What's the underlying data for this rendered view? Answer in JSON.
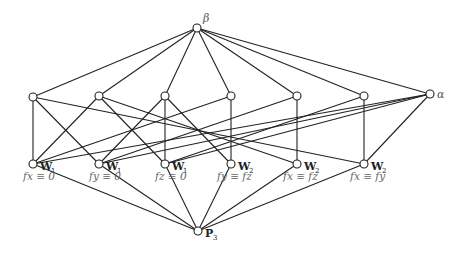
{
  "diagram": {
    "type": "lattice (Hasse diagram)",
    "colors": {
      "line": "#222222",
      "node_fill": "#ffffff",
      "label": "#555555"
    },
    "nodes": [
      {
        "id": "beta",
        "label": "β",
        "x": 197,
        "y": 28
      },
      {
        "id": "m1",
        "label": "",
        "x": 33,
        "y": 97
      },
      {
        "id": "m2",
        "label": "",
        "x": 99,
        "y": 96
      },
      {
        "id": "m3",
        "label": "",
        "x": 165,
        "y": 96
      },
      {
        "id": "m4",
        "label": "",
        "x": 231,
        "y": 96
      },
      {
        "id": "m5",
        "label": "",
        "x": 297,
        "y": 96
      },
      {
        "id": "m6",
        "label": "",
        "x": 364,
        "y": 96
      },
      {
        "id": "alpha",
        "label": "α",
        "x": 430,
        "y": 94
      },
      {
        "id": "b1",
        "label": "W",
        "sub": "1",
        "eq": "fx ≡ 0",
        "x": 33,
        "y": 164
      },
      {
        "id": "b2",
        "label": "W",
        "sub": "1",
        "eq": "fy ≡ 0",
        "x": 99,
        "y": 164
      },
      {
        "id": "b3",
        "label": "W",
        "sub": "1",
        "eq": "fz ≡ 0",
        "x": 165,
        "y": 164
      },
      {
        "id": "b4",
        "label": "W",
        "sub": "2",
        "eq": "fy ≡ fz",
        "x": 231,
        "y": 164
      },
      {
        "id": "b5",
        "label": "W",
        "sub": "2",
        "eq": "fx ≡ fz",
        "x": 297,
        "y": 164
      },
      {
        "id": "b6",
        "label": "W",
        "sub": "2",
        "eq": "fx ≡ fy",
        "x": 364,
        "y": 164
      },
      {
        "id": "p3",
        "label": "P",
        "sub": "3",
        "x": 198,
        "y": 231
      }
    ],
    "edges": [
      [
        "beta",
        "m1"
      ],
      [
        "beta",
        "m2"
      ],
      [
        "beta",
        "m3"
      ],
      [
        "beta",
        "m4"
      ],
      [
        "beta",
        "m5"
      ],
      [
        "beta",
        "m6"
      ],
      [
        "beta",
        "alpha"
      ],
      [
        "m1",
        "b1"
      ],
      [
        "m1",
        "b2"
      ],
      [
        "m1",
        "b6"
      ],
      [
        "m2",
        "b1"
      ],
      [
        "m2",
        "b3"
      ],
      [
        "m2",
        "b5"
      ],
      [
        "m3",
        "b2"
      ],
      [
        "m3",
        "b3"
      ],
      [
        "m3",
        "b4"
      ],
      [
        "m4",
        "b4"
      ],
      [
        "m4",
        "b1"
      ],
      [
        "m5",
        "b5"
      ],
      [
        "m5",
        "b2"
      ],
      [
        "m6",
        "b6"
      ],
      [
        "m6",
        "b3"
      ],
      [
        "alpha",
        "b1"
      ],
      [
        "alpha",
        "b2"
      ],
      [
        "alpha",
        "b3"
      ],
      [
        "alpha",
        "b6"
      ],
      [
        "b1",
        "p3"
      ],
      [
        "b2",
        "p3"
      ],
      [
        "b3",
        "p3"
      ],
      [
        "b4",
        "p3"
      ],
      [
        "b5",
        "p3"
      ],
      [
        "b6",
        "p3"
      ]
    ]
  }
}
